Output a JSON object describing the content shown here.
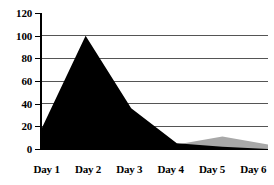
{
  "chart_data": {
    "type": "area",
    "title": "",
    "subtitle": "",
    "xlabel": "",
    "ylabel": "",
    "categories": [
      "Day 1",
      "Day 2",
      "Day 3",
      "Day 4",
      "Day 5",
      "Day 6"
    ],
    "ylim": [
      0,
      120
    ],
    "yticks": [
      0,
      20,
      40,
      60,
      80,
      100,
      120
    ],
    "ytick_labels": [
      "0",
      "20",
      "40",
      "60",
      "80",
      "100",
      "120"
    ],
    "grid": "horizontal",
    "gridlines_at": [
      20,
      40,
      60,
      80,
      100
    ],
    "legend": "none",
    "series": [
      {
        "name": "black-series",
        "color": "#000000",
        "values": [
          15,
          100,
          36,
          5,
          2,
          0
        ]
      },
      {
        "name": "gray-series",
        "color": "#a8a8a8",
        "values": [
          0,
          0,
          0,
          4,
          11,
          4
        ]
      }
    ],
    "colors": {
      "series_black": "#000000",
      "series_gray": "#a8a8a8",
      "axis": "#000000",
      "gridline": "#555555",
      "background": "#ffffff"
    }
  },
  "axes": {
    "y_ticks": [
      {
        "label": "120",
        "value": 120
      },
      {
        "label": "100",
        "value": 100
      },
      {
        "label": "80",
        "value": 80
      },
      {
        "label": "60",
        "value": 60
      },
      {
        "label": "40",
        "value": 40
      },
      {
        "label": "20",
        "value": 20
      },
      {
        "label": "0",
        "value": 0
      }
    ],
    "x_ticks": [
      {
        "label": "Day 1"
      },
      {
        "label": "Day 2"
      },
      {
        "label": "Day 3"
      },
      {
        "label": "Day 4"
      },
      {
        "label": "Day 5"
      },
      {
        "label": "Day 6"
      }
    ]
  }
}
